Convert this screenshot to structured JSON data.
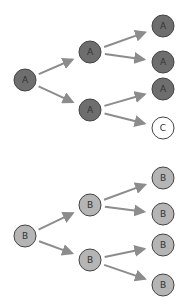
{
  "colors": {
    "node_a_fill": "#6e6e6e",
    "node_b_fill": "#b5b5b5",
    "node_c_fill": "#ffffff",
    "stroke": "#444444",
    "arrow": "#8c8c8c"
  },
  "trees": [
    {
      "name": "tree-a",
      "nodes": [
        {
          "id": "a0",
          "label": "A",
          "x": 25,
          "y": 80,
          "type": "a"
        },
        {
          "id": "a1",
          "label": "A",
          "x": 90,
          "y": 52,
          "type": "a"
        },
        {
          "id": "a2",
          "label": "A",
          "x": 90,
          "y": 110,
          "type": "a"
        },
        {
          "id": "a3",
          "label": "A",
          "x": 163,
          "y": 26,
          "type": "a"
        },
        {
          "id": "a4",
          "label": "A",
          "x": 163,
          "y": 62,
          "type": "a"
        },
        {
          "id": "a5",
          "label": "A",
          "x": 163,
          "y": 89,
          "type": "a"
        },
        {
          "id": "a6",
          "label": "C",
          "x": 163,
          "y": 128,
          "type": "c"
        }
      ],
      "edges": [
        [
          "a0",
          "a1"
        ],
        [
          "a0",
          "a2"
        ],
        [
          "a1",
          "a3"
        ],
        [
          "a1",
          "a4"
        ],
        [
          "a2",
          "a5"
        ],
        [
          "a2",
          "a6"
        ]
      ]
    },
    {
      "name": "tree-b",
      "nodes": [
        {
          "id": "b0",
          "label": "B",
          "x": 25,
          "y": 236,
          "type": "b"
        },
        {
          "id": "b1",
          "label": "B",
          "x": 90,
          "y": 205,
          "type": "b"
        },
        {
          "id": "b2",
          "label": "B",
          "x": 90,
          "y": 260,
          "type": "b"
        },
        {
          "id": "b3",
          "label": "B",
          "x": 163,
          "y": 178,
          "type": "b"
        },
        {
          "id": "b4",
          "label": "B",
          "x": 163,
          "y": 214,
          "type": "b"
        },
        {
          "id": "b5",
          "label": "B",
          "x": 163,
          "y": 245,
          "type": "b"
        },
        {
          "id": "b6",
          "label": "B",
          "x": 163,
          "y": 285,
          "type": "b"
        }
      ],
      "edges": [
        [
          "b0",
          "b1"
        ],
        [
          "b0",
          "b2"
        ],
        [
          "b1",
          "b3"
        ],
        [
          "b1",
          "b4"
        ],
        [
          "b2",
          "b5"
        ],
        [
          "b2",
          "b6"
        ]
      ]
    }
  ]
}
